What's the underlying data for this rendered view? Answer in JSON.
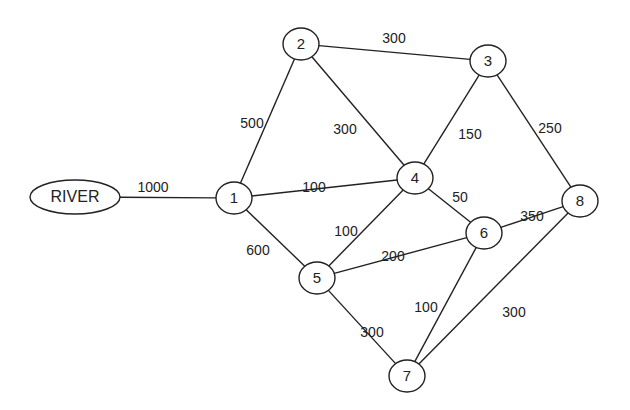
{
  "diagram": {
    "type": "weighted-network-graph",
    "nodes": [
      {
        "id": "RIVER",
        "label": "RIVER",
        "x": 75,
        "y": 197,
        "rx": 45,
        "ry": 17
      },
      {
        "id": "1",
        "label": "1",
        "x": 234,
        "y": 198,
        "rx": 18,
        "ry": 16
      },
      {
        "id": "2",
        "label": "2",
        "x": 301,
        "y": 44,
        "rx": 18,
        "ry": 16
      },
      {
        "id": "3",
        "label": "3",
        "x": 488,
        "y": 61,
        "rx": 18,
        "ry": 16
      },
      {
        "id": "4",
        "label": "4",
        "x": 415,
        "y": 178,
        "rx": 18,
        "ry": 16
      },
      {
        "id": "5",
        "label": "5",
        "x": 317,
        "y": 278,
        "rx": 18,
        "ry": 16
      },
      {
        "id": "6",
        "label": "6",
        "x": 484,
        "y": 233,
        "rx": 18,
        "ry": 16
      },
      {
        "id": "7",
        "label": "7",
        "x": 407,
        "y": 376,
        "rx": 18,
        "ry": 16
      },
      {
        "id": "8",
        "label": "8",
        "x": 580,
        "y": 201,
        "rx": 18,
        "ry": 16
      }
    ],
    "edges": [
      {
        "from": "RIVER",
        "to": "1",
        "weight": "1000",
        "lx": 153,
        "ly": 188
      },
      {
        "from": "1",
        "to": "2",
        "weight": "500",
        "lx": 252,
        "ly": 124
      },
      {
        "from": "1",
        "to": "4",
        "weight": "100",
        "lx": 314,
        "ly": 188
      },
      {
        "from": "1",
        "to": "5",
        "weight": "600",
        "lx": 258,
        "ly": 251
      },
      {
        "from": "2",
        "to": "3",
        "weight": "300",
        "lx": 394,
        "ly": 39
      },
      {
        "from": "2",
        "to": "4",
        "weight": "300",
        "lx": 345,
        "ly": 130
      },
      {
        "from": "3",
        "to": "4",
        "weight": "150",
        "lx": 470,
        "ly": 135
      },
      {
        "from": "3",
        "to": "8",
        "weight": "250",
        "lx": 550,
        "ly": 129
      },
      {
        "from": "4",
        "to": "5",
        "weight": "100",
        "lx": 346,
        "ly": 232
      },
      {
        "from": "4",
        "to": "6",
        "weight": "50",
        "lx": 460,
        "ly": 198
      },
      {
        "from": "5",
        "to": "6",
        "weight": "200",
        "lx": 393,
        "ly": 257
      },
      {
        "from": "6",
        "to": "8",
        "weight": "350",
        "lx": 532,
        "ly": 217
      },
      {
        "from": "5",
        "to": "7",
        "weight": "300",
        "lx": 372,
        "ly": 333
      },
      {
        "from": "6",
        "to": "7",
        "weight": "100",
        "lx": 426,
        "ly": 308
      },
      {
        "from": "7",
        "to": "8",
        "weight": "300",
        "lx": 514,
        "ly": 313
      }
    ],
    "colors": {
      "stroke": "#222222",
      "background": "#ffffff",
      "text": "#222222"
    }
  }
}
